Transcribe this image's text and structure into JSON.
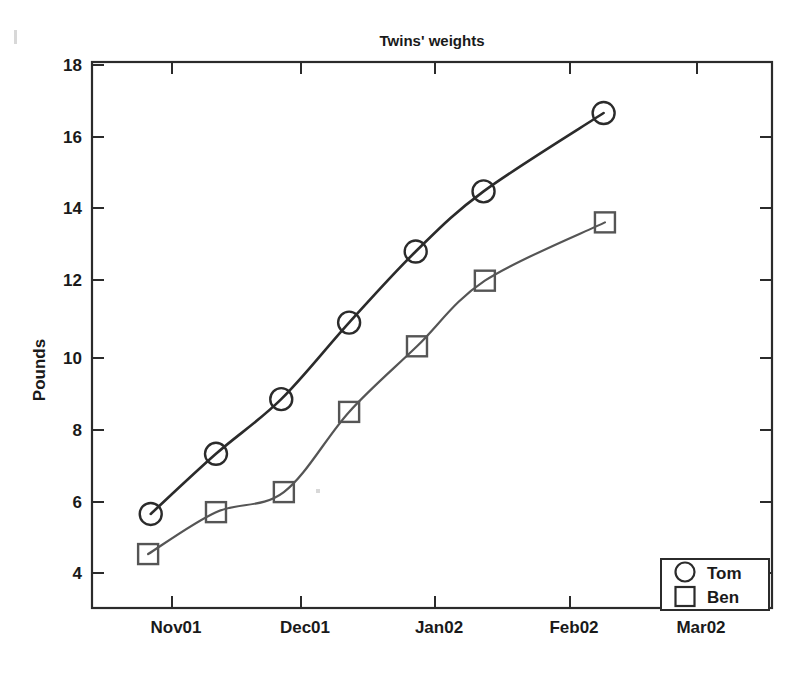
{
  "figure": {
    "title": "Twins' weights",
    "background_color": "#ffffff",
    "axis_color": "#2b2b2b",
    "plot_box": {
      "left": 92,
      "top": 62,
      "right": 772,
      "bottom": 608
    }
  },
  "chart_data": {
    "type": "line",
    "title": "Twins' weights",
    "xlabel": "",
    "ylabel": "Pounds",
    "grid": false,
    "legend_position": "bottom-right",
    "x_tick_labels": [
      "Nov01",
      "Dec01",
      "Jan02",
      "Feb02",
      "Mar02"
    ],
    "x_tick_values": [
      1,
      2,
      3,
      4,
      5
    ],
    "xlim": [
      0.38,
      5.59
    ],
    "y_tick_labels": [
      "4",
      "6",
      "8",
      "10",
      "12",
      "14",
      "16",
      "18"
    ],
    "y_tick_values": [
      4,
      6,
      8,
      10,
      12,
      14,
      16,
      18
    ],
    "ylim": [
      3.02,
      18
    ],
    "series": [
      {
        "name": "Tom",
        "marker": "circle",
        "color": "#2b2b2b",
        "x": [
          0.83,
          1.33,
          1.83,
          2.35,
          2.86,
          3.38,
          4.3
        ],
        "values": [
          5.6,
          7.25,
          8.75,
          10.85,
          12.8,
          14.45,
          16.6
        ]
      },
      {
        "name": "Ben",
        "marker": "square",
        "color": "#555555",
        "x": [
          0.81,
          1.33,
          1.85,
          2.35,
          2.87,
          3.39,
          4.31
        ],
        "values": [
          4.5,
          5.65,
          6.2,
          8.4,
          10.2,
          12.0,
          13.6
        ]
      }
    ]
  },
  "legend": {
    "entries": [
      {
        "label": "Tom",
        "marker": "circle"
      },
      {
        "label": "Ben",
        "marker": "square"
      }
    ]
  }
}
